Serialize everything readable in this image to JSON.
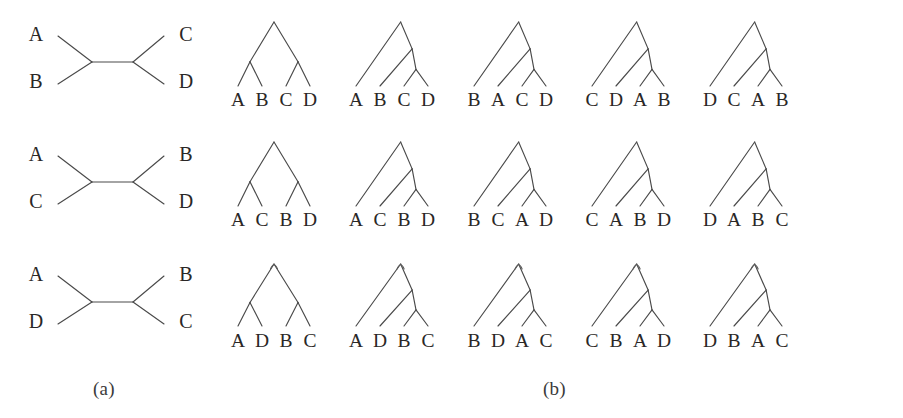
{
  "figure": {
    "panels": [
      {
        "id": "a",
        "caption": "(a)",
        "description": "unrooted four-taxon trees"
      },
      {
        "id": "b",
        "caption": "(b)",
        "description": "rooted four-taxon trees"
      }
    ],
    "taxa": [
      "A",
      "B",
      "C",
      "D"
    ]
  },
  "unrooted_trees": [
    {
      "row": 1,
      "top_left": "A",
      "bottom_left": "B",
      "top_right": "C",
      "bottom_right": "D",
      "split": "AB|CD"
    },
    {
      "row": 2,
      "top_left": "A",
      "bottom_left": "C",
      "top_right": "B",
      "bottom_right": "D",
      "split": "AC|BD"
    },
    {
      "row": 3,
      "top_left": "A",
      "bottom_left": "D",
      "top_right": "B",
      "bottom_right": "C",
      "split": "AD|BC"
    }
  ],
  "rooted_trees": [
    {
      "row": 1,
      "col": 1,
      "shape": "balanced",
      "leaves": [
        "A",
        "B",
        "C",
        "D"
      ]
    },
    {
      "row": 1,
      "col": 2,
      "shape": "ladder",
      "leaves": [
        "A",
        "B",
        "C",
        "D"
      ]
    },
    {
      "row": 1,
      "col": 3,
      "shape": "ladder",
      "leaves": [
        "B",
        "A",
        "C",
        "D"
      ]
    },
    {
      "row": 1,
      "col": 4,
      "shape": "ladder",
      "leaves": [
        "C",
        "D",
        "A",
        "B"
      ]
    },
    {
      "row": 1,
      "col": 5,
      "shape": "ladder",
      "leaves": [
        "D",
        "C",
        "A",
        "B"
      ]
    },
    {
      "row": 2,
      "col": 1,
      "shape": "balanced",
      "leaves": [
        "A",
        "C",
        "B",
        "D"
      ]
    },
    {
      "row": 2,
      "col": 2,
      "shape": "ladder",
      "leaves": [
        "A",
        "C",
        "B",
        "D"
      ]
    },
    {
      "row": 2,
      "col": 3,
      "shape": "ladder",
      "leaves": [
        "B",
        "C",
        "A",
        "D"
      ]
    },
    {
      "row": 2,
      "col": 4,
      "shape": "ladder",
      "leaves": [
        "C",
        "A",
        "B",
        "D"
      ]
    },
    {
      "row": 2,
      "col": 5,
      "shape": "ladder",
      "leaves": [
        "D",
        "A",
        "B",
        "C"
      ]
    },
    {
      "row": 3,
      "col": 1,
      "shape": "balanced",
      "leaves": [
        "A",
        "D",
        "B",
        "C"
      ]
    },
    {
      "row": 3,
      "col": 2,
      "shape": "ladder",
      "leaves": [
        "A",
        "D",
        "B",
        "C"
      ]
    },
    {
      "row": 3,
      "col": 3,
      "shape": "ladder",
      "leaves": [
        "B",
        "D",
        "A",
        "C"
      ]
    },
    {
      "row": 3,
      "col": 4,
      "shape": "ladder",
      "leaves": [
        "C",
        "B",
        "A",
        "D"
      ]
    },
    {
      "row": 3,
      "col": 5,
      "shape": "ladder",
      "leaves": [
        "D",
        "B",
        "A",
        "C"
      ]
    }
  ],
  "style": {
    "line_color": "#4a4a4a",
    "text_color": "#2a2726",
    "background": "#ffffff"
  }
}
